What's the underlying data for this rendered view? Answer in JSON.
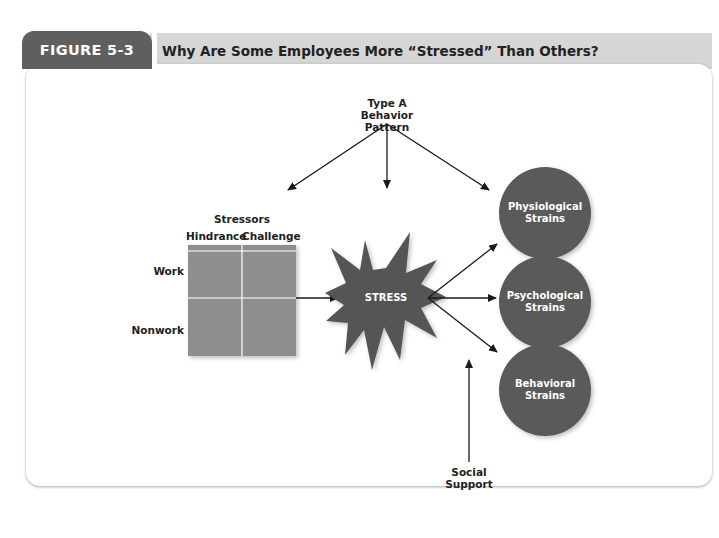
{
  "header": {
    "figure_label": "FIGURE 5-3",
    "title": "Why Are Some Employees More “Stressed” Than Others?"
  },
  "diagram": {
    "top_factor": {
      "line1": "Type A",
      "line2": "Behavior Pattern"
    },
    "stressors": {
      "title": "Stressors",
      "columns": [
        "Hindrance",
        "Challenge"
      ],
      "rows": [
        "Work",
        "Nonwork"
      ]
    },
    "center": {
      "label": "STRESS"
    },
    "outcomes": [
      {
        "line1": "Physiological",
        "line2": "Strains"
      },
      {
        "line1": "Psychological",
        "line2": "Strains"
      },
      {
        "line1": "Behavioral",
        "line2": "Strains"
      }
    ],
    "bottom_factor": {
      "line1": "Social",
      "line2": "Support"
    },
    "colors": {
      "tab": "#5f5f5f",
      "header_bar": "#d6d6d6",
      "grid": "#8e8e8e",
      "star": "#555555",
      "circle": "#5a5a5a",
      "arrow": "#1a1a1a"
    }
  }
}
